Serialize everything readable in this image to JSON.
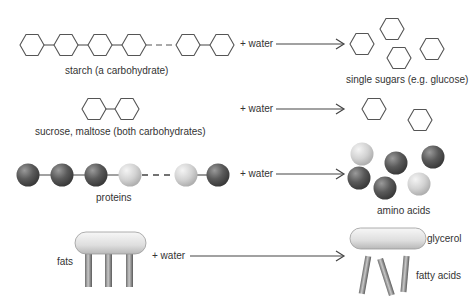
{
  "colors": {
    "line": "#555555",
    "sphere_dark": "#555555",
    "sphere_light": "#cfcfcf",
    "glycerol": "#e2e2e2",
    "fatty_acid": "#8a8a8a"
  },
  "rows": [
    {
      "id": "starch",
      "reactant_label": "starch (a carbohydrate)",
      "reagent": "+ water",
      "product_label": "single sugars (e.g. glucose)",
      "reactant_icon": "hexagon-chain",
      "product_icon": "hexagon"
    },
    {
      "id": "disaccharide",
      "reactant_label": "sucrose, maltose (both carbohydrates)",
      "reagent": "+ water",
      "product_label": "",
      "reactant_icon": "hexagon-pair",
      "product_icon": "hexagon"
    },
    {
      "id": "proteins",
      "reactant_label": "proteins",
      "reagent": "+ water",
      "product_label": "amino acids",
      "reactant_icon": "sphere-chain",
      "product_icon": "sphere"
    },
    {
      "id": "fats",
      "reactant_label": "fats",
      "reagent": "+ water",
      "product_labels": [
        "glycerol",
        "fatty acids"
      ],
      "reactant_icon": "glycerol-with-fatty-acids",
      "product_icon": "glycerol-and-fatty-acid-rods"
    }
  ]
}
